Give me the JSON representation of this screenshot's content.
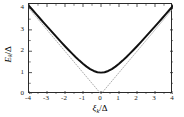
{
  "figure": {
    "background": "#ffffff",
    "frame_color": "#2b2b2b",
    "curve_color": "#111111",
    "asymptote_color": "#9a9a9a"
  },
  "axes": {
    "x_title_html": "ξ",
    "x_title_sub": "k",
    "x_title_tail": "/Δ",
    "y_title_html": "E",
    "y_title_sub": "k",
    "y_title_tail": "/Δ"
  },
  "chart_data": {
    "type": "line",
    "title": "",
    "subtitle": "",
    "xlabel": "ξ_k/Δ",
    "ylabel": "E_k/Δ",
    "xlim": [
      -4,
      4
    ],
    "ylim": [
      0,
      4.21
    ],
    "grid": false,
    "legend_position": "none",
    "xticks": [
      -4,
      -3,
      -2,
      -1,
      0,
      1,
      2,
      3,
      4
    ],
    "xtick_labels": [
      "-4",
      "-3",
      "-2",
      "-1",
      "0",
      "1",
      "2",
      "3",
      "4"
    ],
    "yticks": [
      0,
      1,
      2,
      3,
      4
    ],
    "ytick_labels": [
      "0",
      "1",
      "2",
      "3",
      "4"
    ],
    "tick_direction": "in",
    "series": [
      {
        "name": "E_k/Δ = sqrt((ξ_k/Δ)^2 + 1)",
        "style": "solid",
        "color": "#111111",
        "linewidth": 2.0,
        "x": [
          -4.0,
          -3.8,
          -3.6,
          -3.4,
          -3.2,
          -3.0,
          -2.8,
          -2.6,
          -2.4,
          -2.2,
          -2.0,
          -1.8,
          -1.6,
          -1.4,
          -1.2,
          -1.0,
          -0.8,
          -0.6,
          -0.4,
          -0.2,
          0.0,
          0.2,
          0.4,
          0.6,
          0.8,
          1.0,
          1.2,
          1.4,
          1.6,
          1.8,
          2.0,
          2.2,
          2.4,
          2.6,
          2.8,
          3.0,
          3.2,
          3.4,
          3.6,
          3.8,
          4.0
        ],
        "y": [
          4.123,
          3.929,
          3.736,
          3.544,
          3.353,
          3.162,
          2.973,
          2.786,
          2.6,
          2.417,
          2.236,
          2.059,
          1.887,
          1.72,
          1.562,
          1.414,
          1.281,
          1.166,
          1.077,
          1.02,
          1.0,
          1.02,
          1.077,
          1.166,
          1.281,
          1.414,
          1.562,
          1.72,
          1.887,
          2.059,
          2.236,
          2.417,
          2.6,
          2.786,
          2.973,
          3.162,
          3.353,
          3.544,
          3.736,
          3.929,
          4.123
        ]
      },
      {
        "name": "asymptote y = -x (ξ<0)",
        "style": "dotted",
        "color": "#9a9a9a",
        "linewidth": 0.8,
        "x": [
          -4.0,
          0.0
        ],
        "y": [
          4.0,
          0.0
        ]
      },
      {
        "name": "asymptote y = x (ξ>0)",
        "style": "dotted",
        "color": "#9a9a9a",
        "linewidth": 0.8,
        "x": [
          0.0,
          4.0
        ],
        "y": [
          0.0,
          4.0
        ]
      }
    ]
  }
}
